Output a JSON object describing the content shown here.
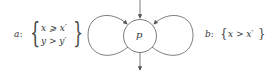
{
  "diagram": {
    "type": "state-loop-diagram",
    "node": {
      "label": "p"
    },
    "left_loop": {
      "name": "a",
      "name_suffix": ":",
      "constraints": [
        "x ⩾ x′",
        "y > y′"
      ]
    },
    "right_loop": {
      "name": "b",
      "name_suffix": ":",
      "constraints": [
        "x > x′"
      ]
    },
    "edges": [
      "incoming-top",
      "outgoing-bottom",
      "self-loop-a",
      "self-loop-b"
    ],
    "colors": {
      "stroke": "#6e6e6e",
      "text": "#333333"
    }
  }
}
